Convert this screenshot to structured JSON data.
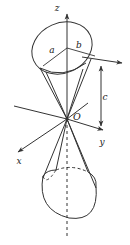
{
  "figure": {
    "type": "geometry-diagram",
    "stroke_color": "#333333",
    "background_color": "#ffffff",
    "labels": {
      "z_axis": "z",
      "y_axis": "y",
      "x_axis": "x",
      "origin": "O",
      "semi_axis_a": "a",
      "semi_axis_b": "b",
      "height_c": "c"
    },
    "geometry": {
      "origin": {
        "x": 67,
        "y": 119
      },
      "z_axis": {
        "top_x": 67,
        "top_y": 10,
        "bottom_x": 67,
        "bottom_y": 238
      },
      "top_ellipse": {
        "cx": 62,
        "cy": 48,
        "rx": 31,
        "ry": 25,
        "rotation": -24
      },
      "bottom_ellipse": {
        "cx": 69,
        "cy": 193,
        "rx": 31,
        "ry": 25,
        "rotation": -24
      },
      "c_dimension": {
        "x": 101,
        "top_y": 62,
        "bottom_y": 130
      }
    }
  }
}
